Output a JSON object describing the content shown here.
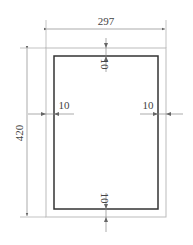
{
  "drawing": {
    "title": "Drawing sheet frame with margins",
    "sheet_width_label": "297",
    "sheet_height_label": "420",
    "margin_top_label": "10",
    "margin_bottom_label": "10",
    "margin_left_label": "10",
    "margin_right_label": "10",
    "colors": {
      "outer_border": "#bbbbbb",
      "inner_frame": "#333333",
      "dimension_line": "#888888",
      "text": "#444444"
    }
  }
}
